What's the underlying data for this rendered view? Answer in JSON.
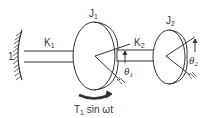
{
  "diagram": {
    "ground_label": "1",
    "shaft1": {
      "label": "K",
      "subscript": "1"
    },
    "shaft2": {
      "label": "K",
      "subscript": "2"
    },
    "disk1": {
      "label": "J",
      "subscript": "1"
    },
    "disk2": {
      "label": "J",
      "subscript": "2"
    },
    "angle1": {
      "label": "θ",
      "subscript": "1"
    },
    "angle2": {
      "label": "θ",
      "subscript": "2"
    },
    "torque": {
      "label": "T",
      "subscript": "1",
      "suffix": " sin ωt"
    },
    "colors": {
      "stroke": "#333333",
      "background": "#ffffff"
    }
  }
}
